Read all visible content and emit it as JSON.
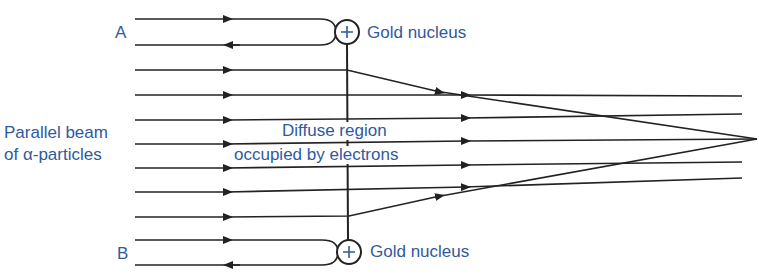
{
  "diagram": {
    "colors": {
      "label": "#2f5a9e",
      "line": "#222222"
    },
    "labels": {
      "a": "A",
      "b": "B",
      "nucleus_top": "Gold nucleus",
      "nucleus_bottom": "Gold nucleus",
      "beam_line1": "Parallel beam",
      "beam_line2": "of α-particles",
      "region_line1": "Diffuse region",
      "region_line2": "occupied by electrons"
    },
    "nucleus_symbol": "+",
    "nuclei": [
      {
        "id": "A",
        "cx": 347,
        "cy": 32,
        "r": 12
      },
      {
        "id": "B",
        "cx": 349,
        "cy": 252,
        "r": 12
      }
    ],
    "beam_lines_y": [
      19,
      45,
      70,
      95,
      120,
      144,
      168,
      192,
      217,
      240,
      265
    ],
    "focus_point": {
      "x": 757,
      "y": 139
    }
  }
}
